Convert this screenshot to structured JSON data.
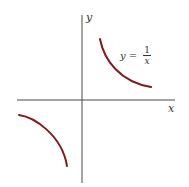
{
  "figure": {
    "axis_labels": {
      "x": "x",
      "y": "y"
    },
    "equation": {
      "lhs": "y",
      "equals": "=",
      "numerator": "1",
      "denominator": "x"
    },
    "colors": {
      "curve": "#7a1e1e",
      "axis": "#4a4a4a",
      "text": "#333333"
    },
    "function": "y = 1/x",
    "branches": [
      {
        "name": "first-quadrant",
        "x_range": "positive",
        "y_range": "positive"
      },
      {
        "name": "third-quadrant",
        "x_range": "negative",
        "y_range": "negative"
      }
    ]
  }
}
